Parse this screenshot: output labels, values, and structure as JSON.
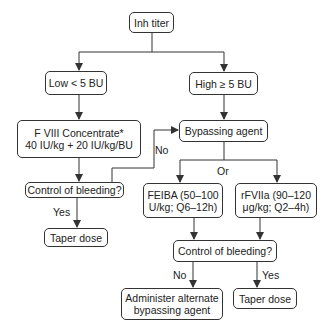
{
  "nodes": {
    "inh_titer": "Inh titer",
    "low": "Low < 5 BU",
    "high": "High ≥ 5 BU",
    "fviii": "F VIII Concentrate*\n40 IU/kg + 20 IU/kg/BU",
    "bypassing": "Bypassing agent",
    "control_left": "Control of bleeding?",
    "taper_left": "Taper dose",
    "feiba": "FEIBA (50–100\nU/kg; Q6–12h)",
    "rfviia": "rFVIIa (90–120\nμg/kg; Q2–4h)",
    "control_right": "Control of bleeding?",
    "administer": "Administer alternate\nbypassing agent",
    "taper_right": "Taper dose"
  },
  "edge_labels": {
    "no_left": "No",
    "yes_left": "Yes",
    "or": "Or",
    "no_right": "No",
    "yes_right": "Yes"
  },
  "colors": {
    "line": "#333333",
    "background": "#ffffff"
  }
}
